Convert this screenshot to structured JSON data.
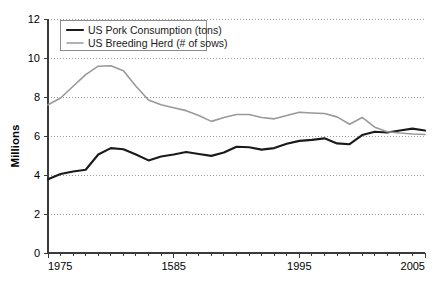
{
  "chart_data": {
    "type": "line",
    "title": "",
    "xlabel": "",
    "ylabel": "Millions",
    "xlim": [
      1975,
      2005
    ],
    "ylim": [
      0,
      12
    ],
    "y_ticks": [
      0,
      2,
      4,
      6,
      8,
      10,
      12
    ],
    "x_ticks_major": [
      1975,
      1585,
      1995,
      2005
    ],
    "x_tick_labels": [
      "1975",
      "1585",
      "1995",
      "2005"
    ],
    "x_tick_positions": [
      1975,
      1985,
      1995,
      2005
    ],
    "x_tick_interval_minor": 1,
    "grid": true,
    "grid_axis": "y",
    "legend_position": "top-left",
    "x": [
      1975,
      1976,
      1977,
      1978,
      1979,
      1980,
      1981,
      1982,
      1983,
      1984,
      1985,
      1986,
      1987,
      1988,
      1989,
      1990,
      1991,
      1992,
      1993,
      1994,
      1995,
      1996,
      1997,
      1998,
      1999,
      2000,
      2001,
      2002,
      2003,
      2004,
      2005
    ],
    "series": [
      {
        "name": "US Pork Consumption (tons)",
        "color": "#1a1a1a",
        "width": 2.1,
        "values": [
          3.78,
          4.05,
          4.18,
          4.27,
          5.05,
          5.38,
          5.32,
          5.05,
          4.75,
          4.95,
          5.05,
          5.18,
          5.08,
          4.98,
          5.15,
          5.45,
          5.42,
          5.3,
          5.38,
          5.6,
          5.75,
          5.8,
          5.88,
          5.62,
          5.58,
          6.05,
          6.22,
          6.18,
          6.28,
          6.38,
          6.28
        ]
      },
      {
        "name": "US Breeding Herd (# of sows)",
        "color": "#999999",
        "width": 1.6,
        "values": [
          7.6,
          7.95,
          8.55,
          9.15,
          9.58,
          9.6,
          9.35,
          8.55,
          7.85,
          7.6,
          7.45,
          7.3,
          7.05,
          6.75,
          6.95,
          7.1,
          7.1,
          6.95,
          6.88,
          7.05,
          7.22,
          7.18,
          7.15,
          6.98,
          6.6,
          6.95,
          6.45,
          6.22,
          6.15,
          6.1,
          6.08
        ]
      }
    ],
    "legend": [
      {
        "label": "US Pork Consumption (tons)",
        "color": "#1a1a1a",
        "width": 2.1
      },
      {
        "label": "US Breeding Herd (# of sows)",
        "color": "#999999",
        "width": 1.6
      }
    ]
  }
}
